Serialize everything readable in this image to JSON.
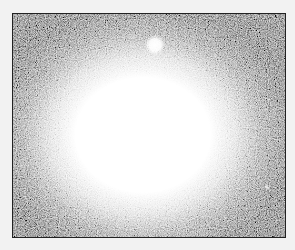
{
  "image": {
    "subject": "elliptical galaxy",
    "colors": {
      "background": "#f2f2f2",
      "sky": "#3a3a3a",
      "core": "#ffffff"
    },
    "features": [
      {
        "name": "galaxy-core",
        "cx": 130,
        "cy": 121,
        "rx": 118,
        "ry": 100
      },
      {
        "name": "bright-knot",
        "cx": 142,
        "cy": 31,
        "r": 7
      },
      {
        "name": "faint-spot",
        "cx": 254,
        "cy": 173,
        "r": 2
      }
    ]
  }
}
